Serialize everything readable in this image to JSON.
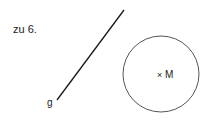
{
  "heading": "zu 6.",
  "line": {
    "label": "g",
    "x1": 57,
    "y1": 100,
    "x2": 124,
    "y2": 10,
    "color": "#1a1a1a"
  },
  "circle": {
    "cx": 161,
    "cy": 74,
    "r": 38,
    "color": "#555555",
    "center_marker": "×",
    "center_label": "M"
  }
}
